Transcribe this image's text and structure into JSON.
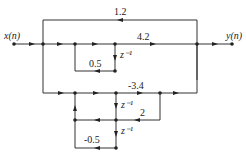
{
  "diagram": {
    "type": "signal-flow-graph",
    "input_label": "x(n)",
    "output_label": "y(n)",
    "gains": {
      "feedforward_top": "1.2",
      "upper_forward": "4.2",
      "upper_feedback": "0.5",
      "lower_forward": "-3.4",
      "lower_mid": "2",
      "lower_feedback": "-0.5"
    },
    "delays": {
      "upper": "z⁻¹",
      "lower_1": "z⁻¹",
      "lower_2": "z⁻¹"
    },
    "colors": {
      "line": "#333333",
      "background": "#ffffff"
    }
  }
}
